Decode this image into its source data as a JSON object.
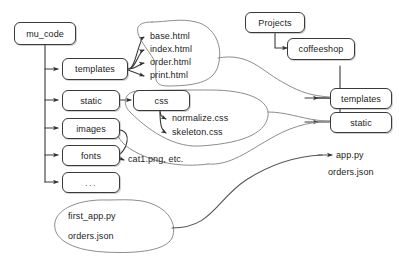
{
  "diagram": {
    "style": {
      "background": "#ffffff",
      "stroke": "#3a3a3a",
      "blob_stroke": "#8d8d8d",
      "text": "#1c1c1c"
    },
    "nodes": {
      "mu_code": "mu_code",
      "templates_left": "templates",
      "static_left": "static",
      "images": "images",
      "fonts": "fonts",
      "ellipsis": "...",
      "css": "css",
      "projects": "Projects",
      "coffeeshop": "coffeeshop",
      "templates_right": "templates",
      "static_right": "static"
    },
    "leaves": {
      "base_html": "base.html",
      "index_html": "index.html",
      "order_html": "order.html",
      "print_html": "print.html",
      "normalize_css": "normalize.css",
      "skeleton_css": "skeleton.css",
      "cat_png": "cat1.png, etc.",
      "app_py": "app.py",
      "orders_json_right": "orders.json"
    },
    "blob_files": {
      "first_app_py": "first_app.py",
      "orders_json": "orders.json"
    }
  }
}
